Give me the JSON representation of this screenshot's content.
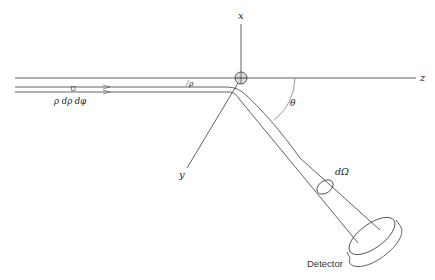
{
  "figure": {
    "type": "scattering-geometry-diagram",
    "axes": {
      "x_label": "x",
      "y_label": "y",
      "z_label": "z"
    },
    "labels": {
      "impact_parameter": "ρ",
      "area_element": "ρ dρ dφ",
      "scattering_angle": "θ",
      "solid_angle": "dΩ",
      "detector": "Detector"
    },
    "colors": {
      "line": "#3a3a3a",
      "background": "#ffffff",
      "target_fill": "#bdbdbd"
    }
  }
}
